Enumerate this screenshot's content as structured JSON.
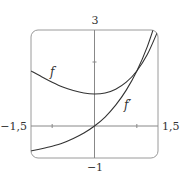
{
  "chart_data": {
    "type": "line",
    "title": "",
    "xlabel": "",
    "ylabel": "",
    "xlim": [
      -1.5,
      1.5
    ],
    "ylim": [
      -1,
      3
    ],
    "grid": false,
    "tick_labels": {
      "x_min": "−1,5",
      "x_max": "1,5",
      "y_min": "−1",
      "y_max": "3"
    },
    "ticks": {
      "x": [
        -1,
        1
      ],
      "y": [
        2
      ]
    },
    "series": [
      {
        "name": "f",
        "label": "f",
        "x": [
          -1.5,
          -1.25,
          -1.0,
          -0.75,
          -0.5,
          -0.25,
          0.0,
          0.25,
          0.5,
          0.75,
          1.0,
          1.25,
          1.5
        ],
        "values": [
          1.72,
          1.54,
          1.37,
          1.22,
          1.11,
          1.03,
          1.0,
          1.03,
          1.15,
          1.37,
          1.72,
          2.24,
          2.98
        ]
      },
      {
        "name": "f'",
        "label": "f′",
        "x": [
          -1.5,
          -1.25,
          -1.0,
          -0.75,
          -0.5,
          -0.25,
          0.0,
          0.25,
          0.5,
          0.75,
          1.0,
          1.25,
          1.5
        ],
        "values": [
          -0.78,
          -0.71,
          -0.63,
          -0.53,
          -0.39,
          -0.22,
          0.0,
          0.28,
          0.65,
          1.12,
          1.72,
          2.49,
          3.48
        ]
      }
    ],
    "annotations": [
      {
        "text": "f",
        "x": -1.03,
        "y": 1.7
      },
      {
        "text": "f′",
        "x": 0.75,
        "y": 0.65
      }
    ],
    "legend": "none (inline labels)"
  },
  "colors": {
    "curve": "#333333",
    "axis": "#888888",
    "frame": "#999999"
  }
}
